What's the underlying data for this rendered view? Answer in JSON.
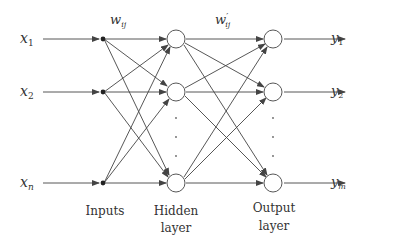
{
  "diagram": {
    "type": "feedforward-neural-network",
    "inputs": [
      {
        "var": "x",
        "sub": "1",
        "y": 39
      },
      {
        "var": "x",
        "sub": "2",
        "y": 92
      },
      {
        "var": "x",
        "sub": "n",
        "y": 183
      }
    ],
    "outputs": [
      {
        "var": "y",
        "sub": "1",
        "y": 39
      },
      {
        "var": "y",
        "sub": "2",
        "y": 92
      },
      {
        "var": "y",
        "sub": "m",
        "y": 183
      }
    ],
    "weights": {
      "input_hidden": {
        "var": "w",
        "sub": "ij"
      },
      "hidden_output": {
        "var": "w",
        "prime": "′",
        "sub": "ij"
      }
    },
    "labels": {
      "inputs": "Inputs",
      "hidden_1": "Hidden",
      "hidden_2": "layer",
      "output_1": "Output",
      "output_2": "layer"
    },
    "ellipsis": "⋮",
    "colors": {
      "line": "#444444",
      "node_fill": "#ffffff",
      "text": "#333333"
    }
  }
}
